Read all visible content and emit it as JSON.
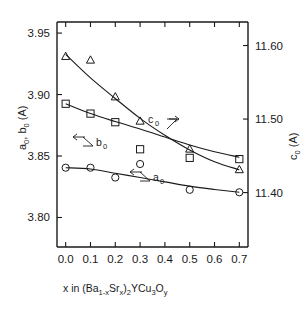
{
  "chart_data": {
    "type": "scatter",
    "title": "",
    "xlabel": "x  in (Ba1-xSrx)2YCu3Oy",
    "xlabel_parts": {
      "lead": "x  in (Ba",
      "sub1": "1-x",
      "mid1": "Sr",
      "sub2": "x",
      "mid2": ")",
      "sub3": "2",
      "mid3": "YCu",
      "sub4": "3",
      "mid4": "O",
      "sub5": "y"
    },
    "ylabel_left": "a0, b0 (A)",
    "ylabel_left_parts": {
      "a": "a",
      "a_sub": "0",
      "comma": ", ",
      "b": "b",
      "b_sub": "0",
      "unit": " (A)"
    },
    "ylabel_right": "c0 (A)",
    "ylabel_right_parts": {
      "c": "c",
      "c_sub": "0",
      "unit": " (A)"
    },
    "x": [
      0.0,
      0.1,
      0.2,
      0.3,
      0.5,
      0.7
    ],
    "xlim": [
      -0.035,
      0.735
    ],
    "xticks": [
      0.0,
      0.1,
      0.2,
      0.3,
      0.4,
      0.5,
      0.6,
      0.7
    ],
    "xticklabels": [
      "0.0",
      "0.1",
      "0.2",
      "0.3",
      "0.4",
      "0.5",
      "0.6",
      "0.7"
    ],
    "ylim_left": [
      3.776,
      3.959
    ],
    "yticks_left": [
      3.95,
      3.9,
      3.85,
      3.8
    ],
    "yticklabels_left": [
      "3.95",
      "3.90",
      "3.85",
      "3.80"
    ],
    "ylim_right": [
      11.326,
      11.632
    ],
    "yticks_right": [
      11.6,
      11.5,
      11.4
    ],
    "yticklabels_right": [
      "11.60",
      "11.50",
      "11.40"
    ],
    "grid": false,
    "legend": "inline-annotations",
    "series": [
      {
        "name": "c0",
        "axis": "right",
        "marker": "triangle-up-open",
        "annotation": "c0",
        "annotation_arrow": "right",
        "values": [
          11.585,
          11.58,
          11.53,
          11.497,
          11.459,
          11.431
        ]
      },
      {
        "name": "b0",
        "axis": "left",
        "marker": "square-open",
        "annotation": "b0",
        "annotation_arrow": "left",
        "values": [
          3.8925,
          3.8845,
          3.8775,
          3.8555,
          3.8485,
          3.8475
        ]
      },
      {
        "name": "a0",
        "axis": "left",
        "marker": "circle-open",
        "annotation": "a0",
        "annotation_arrow": "left",
        "values": [
          3.8405,
          3.8405,
          3.8325,
          3.8435,
          3.8225,
          3.8205
        ]
      }
    ],
    "fit_curves": [
      {
        "name": "c0-fit",
        "axis": "right",
        "points": [
          [
            0.0,
            11.588
          ],
          [
            0.1,
            11.556
          ],
          [
            0.2,
            11.528
          ],
          [
            0.3,
            11.501
          ],
          [
            0.4,
            11.478
          ],
          [
            0.5,
            11.458
          ],
          [
            0.6,
            11.442
          ],
          [
            0.7,
            11.431
          ]
        ]
      },
      {
        "name": "b0-fit",
        "axis": "left",
        "points": [
          [
            0.0,
            3.8925
          ],
          [
            0.1,
            3.8845
          ],
          [
            0.2,
            3.878
          ],
          [
            0.3,
            3.872
          ],
          [
            0.4,
            3.8655
          ],
          [
            0.5,
            3.859
          ],
          [
            0.6,
            3.8535
          ],
          [
            0.7,
            3.849
          ]
        ]
      },
      {
        "name": "a0-fit",
        "axis": "left",
        "points": [
          [
            0.0,
            3.8405
          ],
          [
            0.1,
            3.8395
          ],
          [
            0.2,
            3.836
          ],
          [
            0.3,
            3.8325
          ],
          [
            0.4,
            3.829
          ],
          [
            0.5,
            3.8255
          ],
          [
            0.6,
            3.8228
          ],
          [
            0.7,
            3.8205
          ]
        ]
      }
    ]
  },
  "annotations": {
    "c0": {
      "label_main": "c",
      "label_sub": "0"
    },
    "b0": {
      "label_main": "b",
      "label_sub": "0"
    },
    "a0": {
      "label_main": "a",
      "label_sub": "0"
    }
  }
}
